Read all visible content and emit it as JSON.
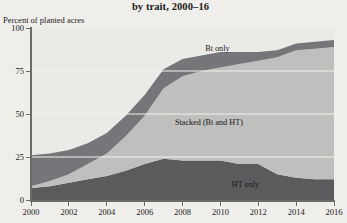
{
  "title": "by trait, 2000–16",
  "axis": {
    "ylabel": "Percent of planted acres",
    "yticks": [
      "0",
      "25",
      "50",
      "75",
      "100"
    ],
    "xticks": [
      "2000",
      "2002",
      "2004",
      "2006",
      "2008",
      "2010",
      "2012",
      "2014",
      "2016"
    ]
  },
  "series_labels": {
    "bt_only": "Bt only",
    "stacked": "Stacked (Bt and HT)",
    "ht_only": "HT only"
  },
  "colors": {
    "plot_background": "#eceae6",
    "bt_only": "#76767a",
    "stacked": "#bfbfbd",
    "ht_only": "#5b5b5e",
    "axis": "#6b6b68",
    "gridline": "#f2f1ee",
    "page_background": "#efeeea"
  },
  "chart_data": {
    "type": "area",
    "stacked": true,
    "title": "by trait, 2000–16",
    "xlabel": "",
    "ylabel": "Percent of planted acres",
    "xlim": [
      2000,
      2016
    ],
    "ylim": [
      0,
      100
    ],
    "grid": true,
    "legend_position": "inline-labels",
    "x": [
      2000,
      2001,
      2002,
      2003,
      2004,
      2005,
      2006,
      2007,
      2008,
      2009,
      2010,
      2011,
      2012,
      2013,
      2014,
      2015,
      2016
    ],
    "series": [
      {
        "name": "HT only",
        "values": [
          7,
          8,
          10,
          12,
          14,
          17,
          21,
          24,
          23,
          23,
          23,
          21,
          21,
          15,
          13,
          12,
          12
        ]
      },
      {
        "name": "Stacked (Bt and HT)",
        "values": [
          1,
          3,
          5,
          9,
          13,
          20,
          28,
          41,
          49,
          52,
          54,
          58,
          60,
          68,
          74,
          76,
          77
        ]
      },
      {
        "name": "Bt only",
        "values": [
          18,
          16,
          14,
          12,
          12,
          12,
          12,
          11,
          10,
          9,
          9,
          7,
          5,
          4,
          4,
          4,
          4
        ]
      }
    ],
    "totals": [
      26,
      27,
      29,
      33,
      39,
      49,
      61,
      76,
      82,
      84,
      86,
      86,
      86,
      87,
      91,
      92,
      93
    ]
  }
}
